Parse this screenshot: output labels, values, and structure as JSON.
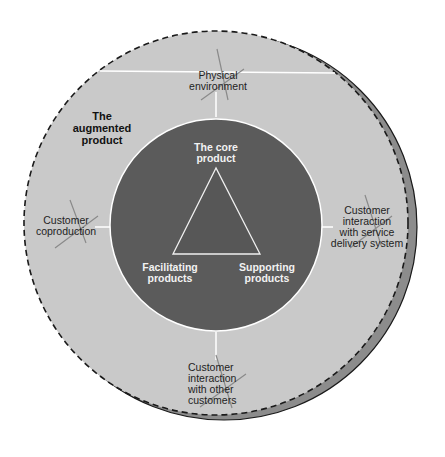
{
  "diagram": {
    "title": "The augmented product",
    "augmented_label": [
      "The",
      "augmented",
      "product"
    ],
    "core": {
      "label": [
        "The core",
        "product"
      ],
      "facilitating": [
        "Facilitating",
        "products"
      ],
      "supporting": [
        "Supporting",
        "products"
      ]
    },
    "augmented_elements": [
      {
        "id": "physical",
        "lines": [
          "Physical",
          "environment"
        ],
        "position": "top"
      },
      {
        "id": "coproduction",
        "lines": [
          "Customer",
          "coproduction"
        ],
        "position": "left"
      },
      {
        "id": "service",
        "lines": [
          "Customer",
          "interaction",
          "with service",
          "delivery system"
        ],
        "position": "right"
      },
      {
        "id": "other",
        "lines": [
          "Customer",
          "interaction",
          "with other",
          "customers"
        ],
        "position": "bottom"
      }
    ],
    "colors": {
      "outer_fill": "#c9c9c9",
      "core_fill": "#5b5b5b",
      "shadow_fill": "#8c8c8c",
      "outline": "#1a1a1a",
      "connector": "#ffffff"
    }
  }
}
